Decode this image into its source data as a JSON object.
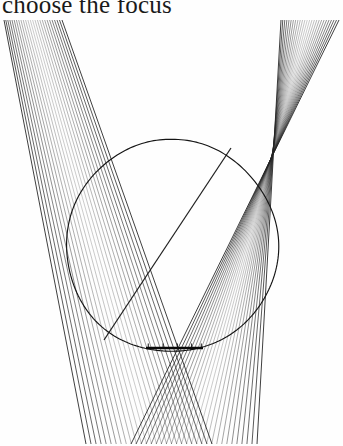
{
  "figure": {
    "caption": "choose the focus",
    "caption_clipped_top": true,
    "background_color": "#ffffff",
    "ink_color": "#242424",
    "title_color": "#1a1a1a"
  },
  "chart_data": {
    "type": "line",
    "title": "choose the focus",
    "subtitle": "",
    "xlabel": "",
    "ylabel": "",
    "grid": false,
    "legend_position": "none",
    "xlim": [
      0,
      343
    ],
    "ylim": [
      0,
      428
    ],
    "elements": [
      {
        "name": "left-ray-fan",
        "kind": "ray-bundle",
        "count": 26,
        "origin_span": {
          "x_start": 4,
          "x_end": 62,
          "y": 2
        },
        "target_span": {
          "x_start": 86,
          "x_end": 212,
          "y": 426
        },
        "color": "#242424"
      },
      {
        "name": "right-ray-fan",
        "kind": "ray-bundle",
        "count": 26,
        "origin_span": {
          "x_start": 281,
          "x_end": 339,
          "y": 2
        },
        "target_span": {
          "x_start": 257,
          "x_end": 131,
          "y": 426
        },
        "color": "#242424"
      },
      {
        "name": "circle",
        "kind": "circle",
        "center_x": 172,
        "center_y": 228,
        "radius": 106,
        "color": "#151515"
      },
      {
        "name": "chord",
        "kind": "segment",
        "x1": 231,
        "y1": 130,
        "x2": 104,
        "y2": 322,
        "color": "#141414"
      },
      {
        "name": "focus-bar",
        "kind": "segment",
        "x1": 146,
        "y1": 330,
        "x2": 203,
        "y2": 330,
        "color": "#080808"
      }
    ],
    "annotations": [
      {
        "text": "choose the focus",
        "x": 2,
        "y": 14,
        "role": "caption"
      }
    ]
  }
}
